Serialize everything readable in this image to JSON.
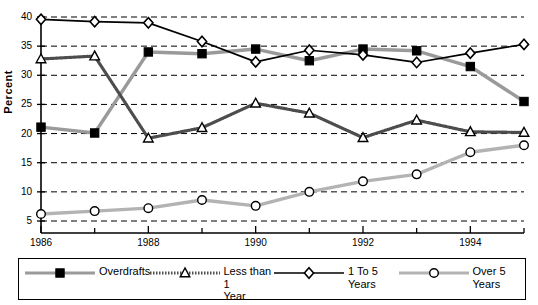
{
  "chart_data": {
    "type": "line",
    "title": "",
    "xlabel": "",
    "ylabel": "Percent",
    "xlim": [
      1986,
      1995
    ],
    "ylim": [
      4,
      40.5
    ],
    "yticks": [
      5,
      10,
      15,
      20,
      25,
      30,
      35,
      40
    ],
    "xticks": [
      1986,
      1987,
      1988,
      1989,
      1990,
      1991,
      1992,
      1993,
      1994,
      1995
    ],
    "xtick_labels_shown": [
      "1986",
      "1988",
      "1990",
      "1992",
      "1994"
    ],
    "grid": "horizontal-dashed",
    "legend_position": "bottom",
    "x": [
      1986,
      1987,
      1988,
      1989,
      1990,
      1991,
      1992,
      1993,
      1994,
      1995
    ],
    "series": [
      {
        "name": "Overdrafts",
        "marker": "filled-square",
        "color": "#9a9a9a",
        "marker_color": "#000000",
        "line_style": "solid",
        "values": [
          21.1,
          20.1,
          34.0,
          33.7,
          34.5,
          32.5,
          34.5,
          34.2,
          31.5,
          25.5
        ]
      },
      {
        "name": "Less than 1\nYear",
        "marker": "open-triangle",
        "color": "#666666",
        "marker_color": "#000000",
        "line_style": "dotted-hatched",
        "values": [
          32.8,
          33.3,
          19.2,
          21.0,
          25.2,
          23.5,
          19.3,
          22.3,
          20.3,
          20.2
        ]
      },
      {
        "name": "1 To 5\nYears",
        "marker": "open-diamond",
        "color": "#000000",
        "marker_color": "#000000",
        "line_style": "solid",
        "values": [
          39.6,
          39.2,
          39.0,
          35.8,
          32.3,
          34.3,
          33.5,
          32.2,
          33.8,
          35.3
        ]
      },
      {
        "name": "Over 5\nYears",
        "marker": "open-circle",
        "color": "#b3b3b3",
        "marker_color": "#000000",
        "line_style": "solid",
        "values": [
          6.2,
          6.7,
          7.2,
          8.6,
          7.6,
          10.0,
          11.8,
          13.0,
          16.8,
          18.0
        ]
      }
    ]
  },
  "legend": {
    "items": [
      {
        "label": "Overdrafts"
      },
      {
        "label": "Less than 1\nYear"
      },
      {
        "label": "1 To 5\nYears"
      },
      {
        "label": "Over 5\nYears"
      }
    ]
  },
  "axes": {
    "y_title": "Percent",
    "y_ticks": [
      "40",
      "35",
      "30",
      "25",
      "20",
      "15",
      "10",
      "5"
    ],
    "x_ticks": [
      "1986",
      "1988",
      "1990",
      "1992",
      "1994"
    ]
  }
}
